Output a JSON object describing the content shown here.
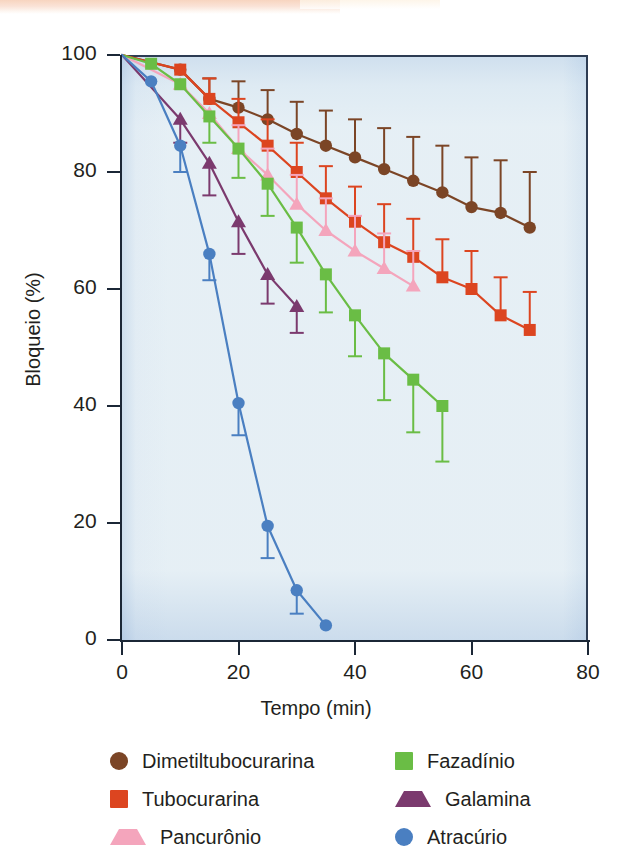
{
  "figure": {
    "background_color": "#eef4f8",
    "axis_color": "#1b2736"
  },
  "axes": {
    "ylabel": "Bloqueio (%)",
    "xlabel": "Tempo (min)",
    "yticks": [
      "0",
      "20",
      "40",
      "60",
      "80",
      "100"
    ],
    "xticks": [
      "0",
      "20",
      "40",
      "60",
      "80"
    ]
  },
  "legend": [
    {
      "label": "Dimetiltubocurarina",
      "marker": "circle",
      "color": "#7b4526"
    },
    {
      "label": "Fazadínio",
      "marker": "square",
      "color": "#6abd45"
    },
    {
      "label": "Tubocurarina",
      "marker": "square",
      "color": "#dc4520"
    },
    {
      "label": "Galamina",
      "marker": "triangle",
      "color": "#7b3a6e"
    },
    {
      "label": "Pancurônio",
      "marker": "triangle",
      "color": "#f4a5bc"
    },
    {
      "label": "Atracúrio",
      "marker": "circle",
      "color": "#4a7fc1"
    }
  ],
  "chart_data": {
    "type": "line",
    "title": "",
    "xlabel": "Tempo (min)",
    "ylabel": "Bloqueio (%)",
    "xlim": [
      0,
      80
    ],
    "ylim": [
      0,
      100
    ],
    "xticks": [
      0,
      20,
      40,
      60,
      80
    ],
    "yticks": [
      0,
      20,
      40,
      60,
      80,
      100
    ],
    "grid": false,
    "legend_position": "below-plot",
    "error_bars": "vertical, one-sided (upper or lower) per point",
    "series": [
      {
        "name": "Dimetiltubocurarina",
        "color": "#7b4526",
        "marker": "circle",
        "x": [
          10,
          15,
          20,
          25,
          30,
          35,
          40,
          45,
          50,
          55,
          60,
          65,
          70
        ],
        "y": [
          97.5,
          92.5,
          91.0,
          89.0,
          86.5,
          84.5,
          82.5,
          80.5,
          78.5,
          76.5,
          74.0,
          73.0,
          70.5
        ],
        "yerr": [
          0,
          3.5,
          4.5,
          5.0,
          5.5,
          6.0,
          6.5,
          7.0,
          7.5,
          8.0,
          8.5,
          9.0,
          9.5
        ]
      },
      {
        "name": "Tubocurarina",
        "color": "#dc4520",
        "marker": "square",
        "x": [
          10,
          15,
          20,
          25,
          30,
          35,
          40,
          45,
          50,
          55,
          60,
          65,
          70
        ],
        "y": [
          97.5,
          92.5,
          88.5,
          84.5,
          80.0,
          75.5,
          71.5,
          68.0,
          65.5,
          62.0,
          60.0,
          55.5,
          53.0
        ],
        "yerr": [
          0,
          3.5,
          4.0,
          4.5,
          5.0,
          5.5,
          6.0,
          6.5,
          6.5,
          6.5,
          6.5,
          6.5,
          6.5
        ]
      },
      {
        "name": "Pancurônio",
        "color": "#f4a5bc",
        "marker": "triangle",
        "x": [
          10,
          15,
          20,
          25,
          30,
          35,
          40,
          45,
          50
        ],
        "y": [
          95.0,
          90.0,
          84.0,
          79.5,
          74.5,
          70.0,
          66.5,
          63.5,
          60.5
        ],
        "yerr": [
          0,
          0,
          4.0,
          4.5,
          5.0,
          5.5,
          6.0,
          6.0,
          6.0
        ]
      },
      {
        "name": "Fazadínio",
        "color": "#6abd45",
        "marker": "square",
        "x": [
          5,
          10,
          15,
          20,
          25,
          30,
          35,
          40,
          45,
          50,
          55
        ],
        "y": [
          98.5,
          95.0,
          89.5,
          84.0,
          78.0,
          70.5,
          62.5,
          55.5,
          49.0,
          44.5,
          40.0
        ],
        "yerr": [
          0,
          0,
          4.5,
          5.0,
          5.5,
          6.0,
          6.5,
          7.0,
          8.0,
          9.0,
          9.5
        ]
      },
      {
        "name": "Galamina",
        "color": "#7b3a6e",
        "marker": "triangle",
        "x": [
          10,
          15,
          20,
          25,
          30
        ],
        "y": [
          89.0,
          81.5,
          71.5,
          62.5,
          57.0
        ],
        "yerr": [
          4.0,
          5.5,
          5.5,
          5.0,
          4.5
        ]
      },
      {
        "name": "Atracúrio",
        "color": "#4a7fc1",
        "marker": "circle",
        "x": [
          5,
          10,
          15,
          20,
          25,
          30,
          35
        ],
        "y": [
          95.5,
          84.5,
          66.0,
          40.5,
          19.5,
          8.5,
          2.5
        ],
        "yerr": [
          0,
          4.5,
          4.5,
          5.5,
          5.5,
          4.0,
          0
        ]
      }
    ]
  }
}
